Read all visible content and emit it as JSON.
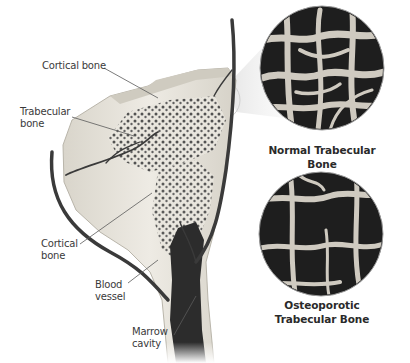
{
  "figure": {
    "labels": {
      "cortical_bone_top": "Cortical bone",
      "trabecular_bone_line1": "Trabecular",
      "trabecular_bone_line2": "bone",
      "cortical_bone_side_line1": "Cortical",
      "cortical_bone_side_line2": "bone",
      "blood_vessel_line1": "Blood",
      "blood_vessel_line2": "vessel",
      "marrow_cavity_line1": "Marrow",
      "marrow_cavity_line2": "cavity"
    },
    "insets": [
      {
        "caption_line1": "Normal Trabecular Bone",
        "caption_line2": ""
      },
      {
        "caption_line1": "Osteoporotic",
        "caption_line2": "Trabecular Bone"
      }
    ],
    "colors": {
      "background": "#ffffff",
      "cortical": "#e6e3da",
      "cortical_edge": "#bdb9ae",
      "trabecular_dots": "#4a4a4a",
      "marrow": "#2c2c2c",
      "vessel": "#3a3a3a",
      "inset_dark": "#1e1e1e",
      "inset_strut": "#cfcac0"
    }
  }
}
